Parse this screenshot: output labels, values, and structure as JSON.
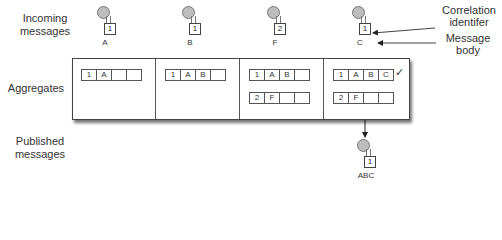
{
  "row_labels": {
    "incoming": "Incoming messages",
    "aggregates": "Aggregates",
    "published": "Published messages"
  },
  "incoming_messages": [
    {
      "correlation_id": "1",
      "body": "A"
    },
    {
      "correlation_id": "1",
      "body": "B"
    },
    {
      "correlation_id": "2",
      "body": "F"
    },
    {
      "correlation_id": "1",
      "body": "C"
    }
  ],
  "aggregate_states": [
    {
      "aggregates": [
        [
          "1",
          "A",
          "",
          ""
        ]
      ]
    },
    {
      "aggregates": [
        [
          "1",
          "A",
          "B",
          ""
        ]
      ]
    },
    {
      "aggregates": [
        [
          "1",
          "A",
          "B",
          ""
        ],
        [
          "2",
          "F",
          "",
          ""
        ]
      ]
    },
    {
      "aggregates": [
        [
          "1",
          "A",
          "B",
          "C"
        ],
        [
          "2",
          "F",
          "",
          ""
        ]
      ],
      "complete_mark": "✓"
    }
  ],
  "published_message": {
    "correlation_id": "1",
    "body": "ABC"
  },
  "annotations": {
    "correlation": "Correlation identifer",
    "body": "Message body"
  }
}
